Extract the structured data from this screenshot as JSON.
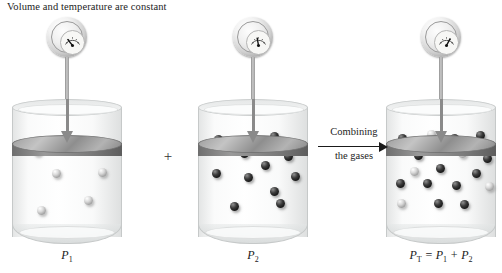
{
  "caption": "Volume and temperature are constant",
  "plus_sign": "+",
  "combine": {
    "line1": "Combining",
    "line2": "the gases"
  },
  "panels": [
    {
      "id": "panel-1",
      "label_main": "P",
      "label_sub": "1",
      "gauge_needle_deg": -38,
      "molecules": [
        {
          "type": "light",
          "x": 21,
          "y": 48
        },
        {
          "type": "light",
          "x": 64,
          "y": 42
        },
        {
          "type": "light",
          "x": 40,
          "y": 70
        },
        {
          "type": "light",
          "x": 86,
          "y": 69
        },
        {
          "type": "light",
          "x": 72,
          "y": 97
        },
        {
          "type": "light",
          "x": 25,
          "y": 107
        }
      ]
    },
    {
      "id": "panel-2",
      "label_main": "P",
      "label_sub": "2",
      "gauge_needle_deg": -10,
      "molecules": [
        {
          "type": "dark",
          "x": 16,
          "y": 36
        },
        {
          "type": "dark",
          "x": 72,
          "y": 33
        },
        {
          "type": "dark",
          "x": 42,
          "y": 50
        },
        {
          "type": "dark",
          "x": 86,
          "y": 53
        },
        {
          "type": "dark",
          "x": 63,
          "y": 62
        },
        {
          "type": "dark",
          "x": 14,
          "y": 70
        },
        {
          "type": "dark",
          "x": 46,
          "y": 74
        },
        {
          "type": "dark",
          "x": 93,
          "y": 73
        },
        {
          "type": "dark",
          "x": 72,
          "y": 88
        },
        {
          "type": "dark",
          "x": 32,
          "y": 103
        },
        {
          "type": "dark",
          "x": 78,
          "y": 100
        }
      ]
    },
    {
      "id": "panel-3",
      "label_main": "P",
      "label_sub": "T",
      "label_rest": " = P",
      "label_sub2": "1",
      "label_plus": " + P",
      "label_sub3": "2",
      "gauge_needle_deg": 28,
      "molecules": [
        {
          "type": "dark",
          "x": 12,
          "y": 35
        },
        {
          "type": "light",
          "x": 41,
          "y": 31
        },
        {
          "type": "dark",
          "x": 64,
          "y": 35
        },
        {
          "type": "dark",
          "x": 90,
          "y": 32
        },
        {
          "type": "dark",
          "x": 28,
          "y": 52
        },
        {
          "type": "light",
          "x": 72,
          "y": 50
        },
        {
          "type": "dark",
          "x": 97,
          "y": 55
        },
        {
          "type": "light",
          "x": 24,
          "y": 68
        },
        {
          "type": "dark",
          "x": 50,
          "y": 65
        },
        {
          "type": "dark",
          "x": 86,
          "y": 70
        },
        {
          "type": "dark",
          "x": 10,
          "y": 80
        },
        {
          "type": "dark",
          "x": 37,
          "y": 80
        },
        {
          "type": "dark",
          "x": 66,
          "y": 82
        },
        {
          "type": "light",
          "x": 99,
          "y": 83
        },
        {
          "type": "light",
          "x": 11,
          "y": 100
        },
        {
          "type": "dark",
          "x": 48,
          "y": 100
        },
        {
          "type": "dark",
          "x": 74,
          "y": 101
        }
      ]
    }
  ]
}
